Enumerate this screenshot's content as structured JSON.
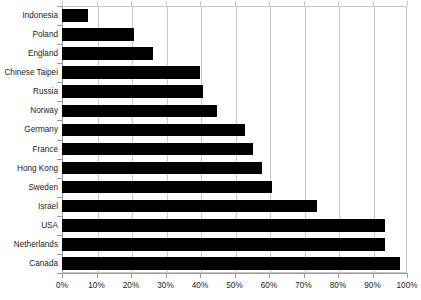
{
  "chart_data": {
    "type": "bar",
    "orientation": "horizontal",
    "title": "",
    "subtitle": "",
    "xlabel": "",
    "ylabel": "",
    "xlim": [
      0,
      100
    ],
    "xtick_labels": [
      "0%",
      "10%",
      "20%",
      "30%",
      "40%",
      "50%",
      "60%",
      "70%",
      "80%",
      "90%",
      "100%"
    ],
    "xtick_values": [
      0,
      10,
      20,
      30,
      40,
      50,
      60,
      70,
      80,
      90,
      100
    ],
    "grid": true,
    "grid_axis": "x",
    "legend": false,
    "legend_position": "none",
    "bar_color": "#000000",
    "grid_color": "#c9c9c9",
    "axis_color": "#9a9a9a",
    "categories": [
      "Indonesia",
      "Poland",
      "England",
      "Chinese Taipei",
      "Russia",
      "Norway",
      "Germany",
      "France",
      "Hong Kong",
      "Sweden",
      "Israel",
      "USA",
      "Netherlands",
      "Canada"
    ],
    "values": [
      7.5,
      21,
      26.5,
      40,
      41,
      45,
      53,
      55.5,
      58,
      61,
      74,
      93.5,
      93.5,
      98
    ]
  }
}
